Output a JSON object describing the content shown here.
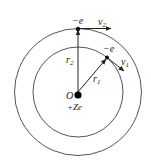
{
  "diagram": {
    "nucleus": {
      "label": "O",
      "charge": "+Ze"
    },
    "inner_orbit": {
      "radius_label": "r",
      "radius_sub": "1",
      "electron_label": "−e",
      "velocity_label": "v",
      "velocity_sub": "1"
    },
    "outer_orbit": {
      "radius_label": "r",
      "radius_sub": "2",
      "electron_label": "−e",
      "velocity_label": "v",
      "velocity_sub": "2"
    }
  }
}
